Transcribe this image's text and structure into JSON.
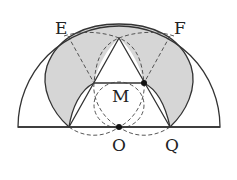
{
  "figure": {
    "type": "geometry-diagram",
    "labels": {
      "E": "E",
      "F": "F",
      "M": "M",
      "O": "O",
      "Q": "Q"
    },
    "points": {
      "O": {
        "x": 119,
        "y": 127,
        "marked": true
      },
      "Q": {
        "x": 170,
        "y": 127,
        "marked": false
      },
      "M_dot": {
        "x": 144,
        "y": 83,
        "marked": true
      },
      "left_node": {
        "x": 94,
        "y": 83,
        "marked": false
      },
      "apex": {
        "x": 119,
        "y": 38,
        "marked": false
      },
      "left_base": {
        "x": 69,
        "y": 127,
        "marked": false
      }
    },
    "colors": {
      "shade": "#d6d6d6",
      "stroke": "#333333",
      "background": "#ffffff"
    }
  }
}
